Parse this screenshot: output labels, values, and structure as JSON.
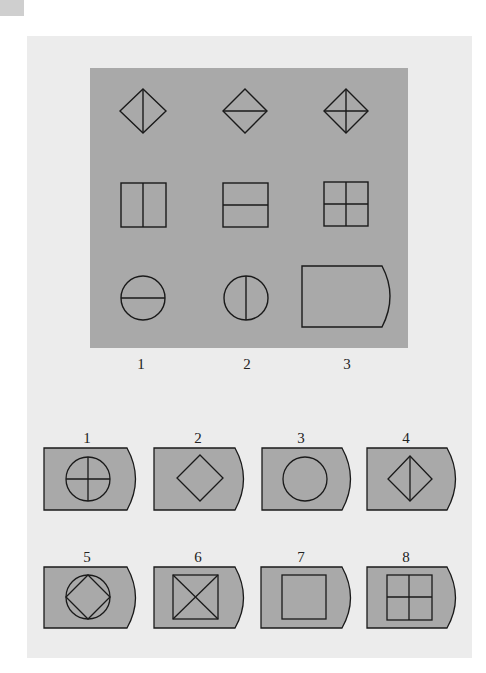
{
  "puzzle": {
    "matrix": {
      "background": "#a9a9a9",
      "cells": [
        {
          "row": 1,
          "col": 1,
          "shape": "diamond",
          "divider": "vertical"
        },
        {
          "row": 1,
          "col": 2,
          "shape": "diamond",
          "divider": "horizontal"
        },
        {
          "row": 1,
          "col": 3,
          "shape": "diamond",
          "divider": "cross"
        },
        {
          "row": 2,
          "col": 1,
          "shape": "square",
          "divider": "vertical"
        },
        {
          "row": 2,
          "col": 2,
          "shape": "square",
          "divider": "horizontal"
        },
        {
          "row": 2,
          "col": 3,
          "shape": "square",
          "divider": "cross"
        },
        {
          "row": 3,
          "col": 1,
          "shape": "circle",
          "divider": "horizontal"
        },
        {
          "row": 3,
          "col": 2,
          "shape": "circle",
          "divider": "vertical"
        },
        {
          "row": 3,
          "col": 3,
          "shape": "blank-answer-tile",
          "divider": "none"
        }
      ],
      "column_labels": [
        "1",
        "2",
        "3"
      ]
    },
    "options": [
      {
        "label": "1",
        "content": "circle with cross"
      },
      {
        "label": "2",
        "content": "diamond"
      },
      {
        "label": "3",
        "content": "circle"
      },
      {
        "label": "4",
        "content": "diamond with vertical line"
      },
      {
        "label": "5",
        "content": "diamond inscribed in circle"
      },
      {
        "label": "6",
        "content": "square with X"
      },
      {
        "label": "7",
        "content": "square"
      },
      {
        "label": "8",
        "content": "square with cross"
      }
    ],
    "colors": {
      "tile_fill": "#a9a9a9",
      "stroke": "#1a1a1a",
      "panel": "#ececec"
    }
  }
}
